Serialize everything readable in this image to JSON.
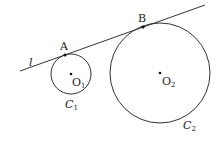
{
  "diagram": {
    "line": {
      "label": "l",
      "x1": 20,
      "y1": 71,
      "x2": 205,
      "y2": 5
    },
    "circles": [
      {
        "name": "C",
        "sub": "1",
        "cx": 71,
        "cy": 74,
        "r": 20,
        "center_label": "O",
        "center_sub": "1"
      },
      {
        "name": "C",
        "sub": "2",
        "cx": 160,
        "cy": 73,
        "r": 50,
        "center_label": "O",
        "center_sub": "2"
      }
    ],
    "points": [
      {
        "label": "A",
        "x": 65,
        "y": 55
      },
      {
        "label": "B",
        "x": 143,
        "y": 27
      }
    ],
    "stroke_color": "#333333"
  }
}
